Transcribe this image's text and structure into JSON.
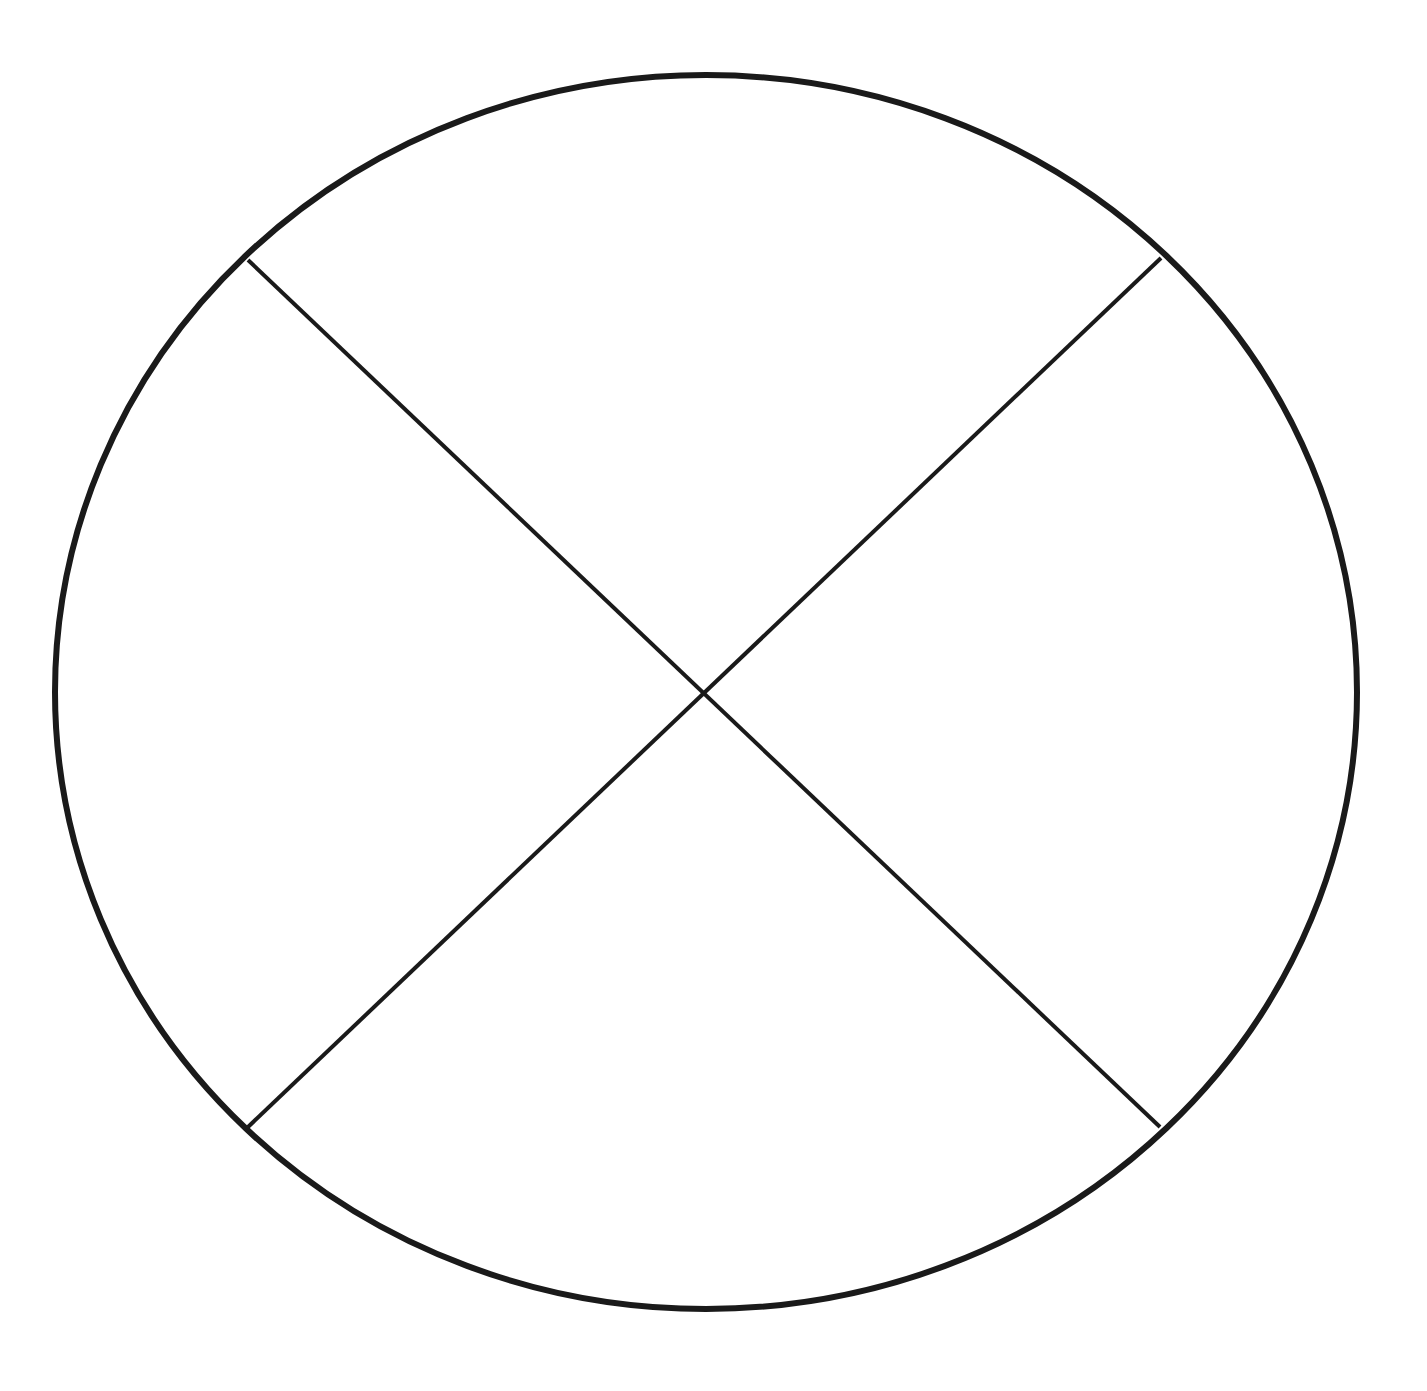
{
  "diagram": {
    "title": "",
    "description": "Circle divided into four sections by two diagonal lines crossing at the center",
    "canvas": {
      "width": 1427,
      "height": 1391,
      "background": "#ffffff"
    },
    "stroke_color": "#1a1a1a",
    "circle": {
      "cx": 706,
      "cy": 692,
      "rx": 651,
      "ry": 617,
      "stroke_width": 6
    },
    "center_point": {
      "x": 706,
      "y": 691
    },
    "lines": [
      {
        "id": "diagonal-top-left-to-bottom-right",
        "x1": 248,
        "y1": 260,
        "x2": 1160,
        "y2": 1127,
        "stroke_width": 4
      },
      {
        "id": "diagonal-top-right-to-bottom-left",
        "x1": 1161,
        "y1": 258,
        "x2": 248,
        "y2": 1127,
        "stroke_width": 4
      }
    ],
    "sections": [
      {
        "id": "top",
        "label": ""
      },
      {
        "id": "right",
        "label": ""
      },
      {
        "id": "bottom",
        "label": ""
      },
      {
        "id": "left",
        "label": ""
      }
    ]
  }
}
